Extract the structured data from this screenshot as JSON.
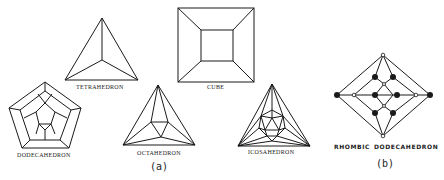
{
  "figure": {
    "panel_a": {
      "label": "(a)",
      "solids": [
        {
          "name": "TETRAHEDRON"
        },
        {
          "name": "CUBE"
        },
        {
          "name": "DODECAHEDRON"
        },
        {
          "name": "OCTAHEDRON"
        },
        {
          "name": "ICOSAHEDRON"
        }
      ]
    },
    "panel_b": {
      "label": "(b)",
      "solid_name_1": "RHOMBIC",
      "solid_name_2": "DODECAHEDRON"
    },
    "line_color": "#1a1a1a"
  }
}
